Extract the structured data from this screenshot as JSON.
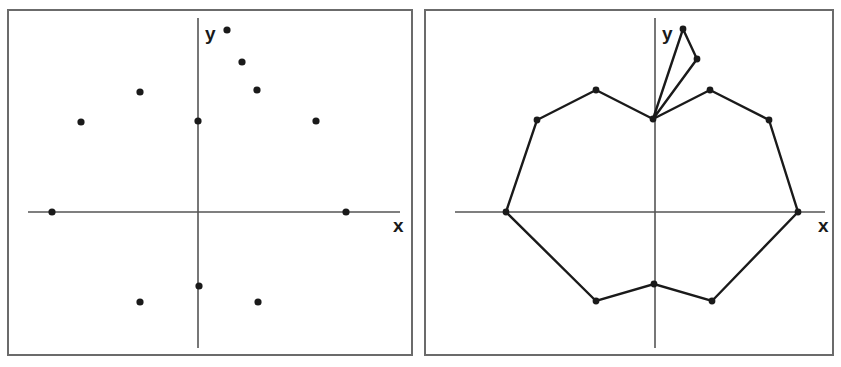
{
  "figure": {
    "background_color": "#ffffff",
    "stroke_color": "#1a1a1a",
    "axis_color": "#555555",
    "frame_color": "#6b6b6b",
    "width": 841,
    "height": 367
  },
  "panels": [
    {
      "id": "left-panel",
      "caption": "",
      "frame": {
        "x": 8,
        "y": 10,
        "width": 404,
        "height": 345
      },
      "origin": {
        "x": 198,
        "y": 212
      },
      "x_axis": {
        "label": "x",
        "x1": 28,
        "x2": 400,
        "y": 212,
        "label_x": 393,
        "label_y": 232
      },
      "y_axis": {
        "label": "y",
        "x": 198,
        "y1": 18,
        "y2": 348,
        "label_x": 205,
        "label_y": 40
      },
      "chart_data": {
        "type": "scatter",
        "title": "",
        "xlabel": "x",
        "ylabel": "y",
        "grid": false,
        "legend": "none",
        "points": [
          {
            "px": 227,
            "py": 30
          },
          {
            "px": 242,
            "py": 62
          },
          {
            "px": 257,
            "py": 90
          },
          {
            "px": 140,
            "py": 92
          },
          {
            "px": 81,
            "py": 122
          },
          {
            "px": 198,
            "py": 121
          },
          {
            "px": 316,
            "py": 121
          },
          {
            "px": 52,
            "py": 212
          },
          {
            "px": 346,
            "py": 212
          },
          {
            "px": 199,
            "py": 286
          },
          {
            "px": 140,
            "py": 302
          },
          {
            "px": 258,
            "py": 302
          }
        ]
      }
    },
    {
      "id": "right-panel",
      "caption": "",
      "frame": {
        "x": 425,
        "y": 10,
        "width": 408,
        "height": 345
      },
      "origin": {
        "x": 655,
        "y": 212
      },
      "x_axis": {
        "label": "x",
        "x1": 455,
        "x2": 825,
        "y": 212,
        "label_x": 818,
        "label_y": 232
      },
      "y_axis": {
        "label": "y",
        "x": 655,
        "y1": 18,
        "y2": 348,
        "label_x": 662,
        "label_y": 40
      },
      "chart_data": {
        "type": "line",
        "title": "",
        "xlabel": "x",
        "ylabel": "y",
        "grid": false,
        "legend": "none",
        "series": [
          {
            "name": "outer-polygon",
            "closed": false,
            "points": [
              {
                "px": 653,
                "py": 119
              },
              {
                "px": 596,
                "py": 90
              },
              {
                "px": 537,
                "py": 120
              },
              {
                "px": 506,
                "py": 212
              },
              {
                "px": 596,
                "py": 301
              },
              {
                "px": 654,
                "py": 284
              },
              {
                "px": 712,
                "py": 301
              },
              {
                "px": 798,
                "py": 212
              },
              {
                "px": 769,
                "py": 120
              },
              {
                "px": 710,
                "py": 90
              },
              {
                "px": 653,
                "py": 119
              }
            ]
          },
          {
            "name": "inner-spike-loop",
            "closed": true,
            "points": [
              {
                "px": 653,
                "py": 119
              },
              {
                "px": 683,
                "py": 29
              },
              {
                "px": 697,
                "py": 59
              }
            ]
          }
        ],
        "vertices": [
          {
            "px": 653,
            "py": 119
          },
          {
            "px": 596,
            "py": 90
          },
          {
            "px": 537,
            "py": 120
          },
          {
            "px": 506,
            "py": 212
          },
          {
            "px": 596,
            "py": 301
          },
          {
            "px": 654,
            "py": 284
          },
          {
            "px": 712,
            "py": 301
          },
          {
            "px": 798,
            "py": 212
          },
          {
            "px": 769,
            "py": 120
          },
          {
            "px": 710,
            "py": 90
          },
          {
            "px": 683,
            "py": 29
          },
          {
            "px": 697,
            "py": 59
          }
        ]
      }
    }
  ]
}
